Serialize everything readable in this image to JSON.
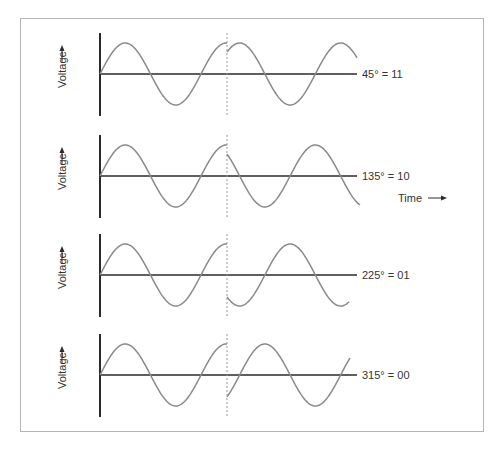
{
  "diagram": {
    "type": "qpsk-phase-shift-waveforms",
    "axis_label": "Voltage",
    "time_label": "Time",
    "colors": {
      "wave": "#8a8a8a",
      "axis": "#2a2a2a",
      "frame": "#b5b5b5",
      "dashed": "#999999"
    },
    "panels": [
      {
        "label": "45° = 11",
        "phase_deg": 45,
        "bits": "11"
      },
      {
        "label": "135° = 10",
        "phase_deg": 135,
        "bits": "10"
      },
      {
        "label": "225° = 01",
        "phase_deg": 225,
        "bits": "01"
      },
      {
        "label": "315° = 00",
        "phase_deg": 315,
        "bits": "00"
      }
    ]
  }
}
